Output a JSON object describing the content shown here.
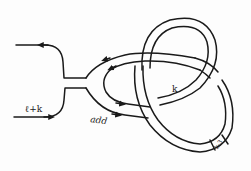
{
  "diagram": {
    "type": "knot-band-diagram",
    "labels": {
      "left_strand": "ℓ+k",
      "add_label": "add",
      "band_label": "k",
      "box_label": "k-3"
    },
    "colors": {
      "ink": "#1a1a1a",
      "background": "#fdfdfd"
    },
    "arrows": {
      "top_left": "left",
      "bottom_left": "right",
      "inner_upper": "left",
      "inner_lower": "right"
    }
  }
}
